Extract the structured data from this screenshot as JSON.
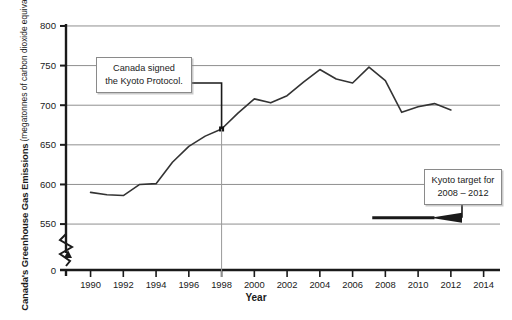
{
  "chart_data": {
    "type": "line",
    "title": "",
    "xlabel": "Year",
    "ylabel": "Canada's Greenhouse Gas Emissions (megatonnes of carbon dioxide equivalent)",
    "ylabel_main": "Canada's Greenhouse Gas Emissions",
    "ylabel_sub": "(megatonnes of carbon dioxide equivalent)",
    "xlim": [
      1988.5,
      2015
    ],
    "ylim": [
      540,
      805
    ],
    "y_axis_break": true,
    "y_break_label": "0",
    "grid": "horizontal",
    "legend": "none",
    "xticks": [
      1990,
      1992,
      1994,
      1996,
      1998,
      2000,
      2002,
      2004,
      2006,
      2008,
      2010,
      2012,
      2014
    ],
    "xticklabels": [
      "1990",
      "1992",
      "1994",
      "1996",
      "1998",
      "2000",
      "2002",
      "2004",
      "2006",
      "2008",
      "2010",
      "2012",
      "2014"
    ],
    "yticks": [
      550,
      600,
      650,
      700,
      750,
      800
    ],
    "yticklabels": [
      "550",
      "600",
      "650",
      "700",
      "750",
      "800"
    ],
    "series": [
      {
        "name": "Canada's greenhouse gas emissions",
        "x": [
          1990,
          1991,
          1992,
          1993,
          1994,
          1995,
          1996,
          1997,
          1998,
          1999,
          2000,
          2001,
          2002,
          2003,
          2004,
          2005,
          2006,
          2007,
          2008,
          2009,
          2010,
          2011,
          2012
        ],
        "values": [
          590,
          587,
          586,
          600,
          601,
          628,
          648,
          661,
          670,
          690,
          708,
          703,
          712,
          729,
          745,
          733,
          728,
          748,
          731,
          691,
          698,
          702,
          694
        ],
        "color": "#333333"
      }
    ],
    "annotations": [
      {
        "name": "kyoto-signed",
        "lines": [
          "Canada signed",
          "the Kyoto Protocol."
        ],
        "points_to_x": 1998,
        "points_to_y": 670,
        "marker": "square"
      },
      {
        "name": "kyoto-target",
        "lines": [
          "Kyoto target for",
          "2008 – 2012"
        ],
        "points_to_y": 558
      }
    ],
    "target_line": {
      "label": "Kyoto target for 2008 – 2012",
      "value": 558,
      "x_start": 2007.2,
      "x_end": 2011.0,
      "color": "#1a1a1a"
    }
  }
}
